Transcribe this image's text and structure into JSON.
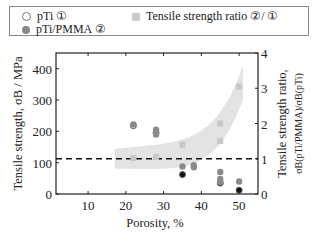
{
  "legend": {
    "items": [
      {
        "label": "pTi  ①",
        "marker": "open-circle"
      },
      {
        "label": "Tensile strength ratio  ②/ ①",
        "marker": "gray-square"
      },
      {
        "label": "pTi/PMMA  ②",
        "marker": "filled-circle"
      }
    ]
  },
  "chart_data": {
    "type": "scatter",
    "title": "",
    "xlabel": "Porosity, %",
    "ylabel": "Tensile strength, σB / MPa",
    "y2label": "Tensile strength ratio, σB(pTi/PMMA)/σB(pTi)",
    "xlim": [
      1.5,
      55
    ],
    "ylim": [
      0,
      450
    ],
    "y2lim": [
      0,
      4
    ],
    "x_ticks": [
      10,
      20,
      30,
      40,
      50
    ],
    "y_ticks": [
      0,
      100,
      200,
      300,
      400
    ],
    "y2_ticks": [
      0,
      1,
      2,
      3,
      4
    ],
    "grid": false,
    "legend_position": "top",
    "reference_line": {
      "axis": "y2",
      "value": 1,
      "style": "dashed"
    },
    "series": [
      {
        "name": "pTi ①",
        "axis": "y",
        "marker": "open-circle",
        "points": [
          [
            22,
            218
          ],
          [
            28,
            195
          ],
          [
            35,
            62
          ],
          [
            45,
            35
          ],
          [
            50,
            12
          ]
        ]
      },
      {
        "name": "pTi/PMMA ②",
        "axis": "y",
        "marker": "filled-circle",
        "points": [
          [
            22,
            222
          ],
          [
            28,
            205
          ],
          [
            28,
            190
          ],
          [
            35,
            88
          ],
          [
            38,
            92
          ],
          [
            38,
            85
          ],
          [
            45,
            70
          ],
          [
            45,
            48
          ],
          [
            45,
            38
          ],
          [
            50,
            40
          ]
        ]
      },
      {
        "name": "Tensile strength ratio ②/①",
        "axis": "y2",
        "marker": "gray-square",
        "points": [
          [
            22,
            1.02
          ],
          [
            28,
            1.05
          ],
          [
            35,
            1.4
          ],
          [
            45,
            2.0
          ],
          [
            45,
            1.5
          ],
          [
            50,
            3.05
          ]
        ]
      }
    ],
    "trend_band": {
      "axis": "y2",
      "description": "shaded gray band rising from ~1 at 20% to ~3 at 50%"
    }
  }
}
